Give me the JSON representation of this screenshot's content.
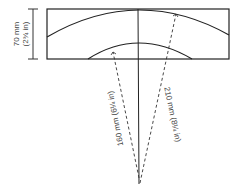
{
  "diagram": {
    "height_dimension": {
      "line1": "70 mm",
      "line2": "(2¾ in)"
    },
    "inner_radius_label": "160 mm (6¼ in)",
    "outer_radius_label": "210 mm (8¼ in)",
    "colors": {
      "stroke": "#222222",
      "text": "#444444",
      "background": "#ffffff"
    }
  }
}
